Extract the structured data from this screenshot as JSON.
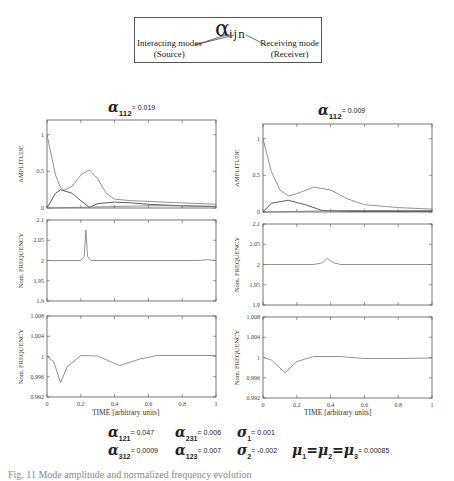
{
  "legend": {
    "symbol": "α",
    "indices": "ijn",
    "left_label": "Interacting modes",
    "left_sub": "(Source)",
    "right_label": "Receiving mode",
    "right_sub": "(Receiver)"
  },
  "left_panel": {
    "title_symbol": "α",
    "title_sub": "112",
    "title_value": "= 0.019",
    "xlabel": "TIME [arbitrary units]"
  },
  "right_panel": {
    "title_symbol": "α",
    "title_sub": "112",
    "title_value": "= 0.009",
    "xlabel": "TIME [arbitrary units]"
  },
  "parameters": [
    {
      "symbol": "α",
      "sub": "121",
      "value": "= 0.047"
    },
    {
      "symbol": "α",
      "sub": "231",
      "value": "= 0.006"
    },
    {
      "symbol": "σ",
      "sub": "1",
      "value": "= 0.001"
    },
    {
      "symbol": "α",
      "sub": "312",
      "value": "= 0.0009"
    },
    {
      "symbol": "α",
      "sub": "123",
      "value": "= 0.007"
    },
    {
      "symbol": "σ",
      "sub": "2",
      "value": "= -0.002"
    },
    {
      "symbol": "μ",
      "text": "μ1= μ2= μ3",
      "value": "= 0.00085"
    }
  ],
  "caption": "Fig. 11 Mode amplitude and normalized frequency evolution",
  "chart_data": [
    {
      "type": "line",
      "panel": "left-amplitude",
      "ylabel": "AMPLITUDE",
      "yticks": [
        "0",
        "0.5",
        "1"
      ],
      "xticks": [
        "0",
        "0.2",
        "0.4",
        "0.6",
        "0.8",
        "1"
      ],
      "ylim": [
        0,
        1.2
      ],
      "xlim": [
        0,
        1
      ],
      "series": [
        {
          "name": "mode 1",
          "x": [
            0,
            0.05,
            0.08,
            0.1,
            0.15,
            0.2,
            0.25,
            0.3,
            0.35,
            0.4,
            0.5,
            0.6,
            0.8,
            1
          ],
          "values": [
            1,
            0.45,
            0.28,
            0.24,
            0.3,
            0.45,
            0.52,
            0.4,
            0.2,
            0.12,
            0.1,
            0.09,
            0.07,
            0.05
          ]
        },
        {
          "name": "mode 2",
          "x": [
            0,
            0.05,
            0.08,
            0.15,
            0.2,
            0.25,
            0.3,
            0.4,
            0.5,
            0.6,
            0.8,
            1
          ],
          "values": [
            0,
            0.2,
            0.25,
            0.2,
            0.1,
            0.01,
            0.06,
            0.08,
            0.07,
            0.05,
            0.03,
            0.02
          ]
        },
        {
          "name": "mode 3",
          "x": [
            0,
            0.2,
            0.4,
            0.6,
            0.8,
            1
          ],
          "values": [
            0,
            0.01,
            0.02,
            0.03,
            0.03,
            0.02
          ]
        }
      ]
    },
    {
      "type": "line",
      "panel": "left-frequency",
      "ylabel": "Nom. FREQUENCY",
      "yticks": [
        "1.9",
        "1.95",
        "2",
        "2.05",
        "2.1"
      ],
      "ylim": [
        1.9,
        2.1
      ],
      "xlim": [
        0,
        1
      ],
      "series": [
        {
          "name": "freq",
          "x": [
            0,
            0.2,
            0.22,
            0.23,
            0.24,
            0.26,
            0.9,
            0.95,
            1
          ],
          "values": [
            2,
            2,
            2.01,
            2.075,
            2.01,
            2,
            2,
            2.002,
            2
          ]
        }
      ]
    },
    {
      "type": "line",
      "panel": "left-nom-frequency",
      "ylabel": "Nom. FREQUENCY",
      "yticks": [
        "0.992",
        "0.996",
        "1",
        "1.004",
        "1.008"
      ],
      "xticks": [
        "0",
        "0.2",
        "0.4",
        "0.6",
        "0.8",
        "1"
      ],
      "ylim": [
        0.992,
        1.008
      ],
      "xlim": [
        0,
        1
      ],
      "series": [
        {
          "name": "freq",
          "x": [
            0,
            0.04,
            0.08,
            0.12,
            0.2,
            0.3,
            0.43,
            0.55,
            0.65,
            1
          ],
          "values": [
            1,
            0.999,
            0.9948,
            0.998,
            1.0002,
            1.0001,
            0.9982,
            0.9995,
            1.0002,
            1.0002
          ]
        }
      ]
    },
    {
      "type": "line",
      "panel": "right-amplitude",
      "ylabel": "AMPLITUDE",
      "yticks": [
        "0",
        "0.5",
        "1"
      ],
      "xticks": [
        "0",
        "0.2",
        "0.4",
        "0.6",
        "0.8",
        "1"
      ],
      "ylim": [
        0,
        1.2
      ],
      "xlim": [
        0,
        1
      ],
      "series": [
        {
          "name": "mode 1",
          "x": [
            0,
            0.05,
            0.1,
            0.15,
            0.2,
            0.3,
            0.4,
            0.5,
            0.6,
            0.8,
            1
          ],
          "values": [
            1,
            0.55,
            0.3,
            0.22,
            0.25,
            0.34,
            0.3,
            0.18,
            0.1,
            0.06,
            0.04
          ]
        },
        {
          "name": "mode 2",
          "x": [
            0,
            0.05,
            0.15,
            0.25,
            0.35,
            0.5,
            1
          ],
          "values": [
            0,
            0.12,
            0.16,
            0.1,
            0.02,
            0.01,
            0.01
          ]
        },
        {
          "name": "mode 3",
          "x": [
            0,
            0.5,
            1
          ],
          "values": [
            0,
            0.02,
            0.02
          ]
        }
      ]
    },
    {
      "type": "line",
      "panel": "right-frequency",
      "ylabel": "Nom. FREQUENCY",
      "yticks": [
        "1.9",
        "1.95",
        "2",
        "2.05",
        "2.1"
      ],
      "ylim": [
        1.9,
        2.1
      ],
      "xlim": [
        0,
        1
      ],
      "series": [
        {
          "name": "freq",
          "x": [
            0,
            0.3,
            0.35,
            0.38,
            0.42,
            0.46,
            1
          ],
          "values": [
            2,
            2,
            2.004,
            2.015,
            2.004,
            2,
            2
          ]
        }
      ]
    },
    {
      "type": "line",
      "panel": "right-nom-frequency",
      "ylabel": "Nom. FREQUENCY",
      "yticks": [
        "0.992",
        "0.996",
        "1",
        "1.004",
        "1.008"
      ],
      "xticks": [
        "0",
        "0.2",
        "0.4",
        "0.6",
        "0.8",
        "1"
      ],
      "ylim": [
        0.992,
        1.008
      ],
      "xlim": [
        0,
        1
      ],
      "series": [
        {
          "name": "freq",
          "x": [
            0,
            0.05,
            0.13,
            0.2,
            0.3,
            0.45,
            0.6,
            0.8,
            1
          ],
          "values": [
            1,
            0.9995,
            0.997,
            0.9992,
            1.0002,
            1.0002,
            0.9998,
            0.9998,
            0.9999
          ]
        }
      ]
    }
  ]
}
